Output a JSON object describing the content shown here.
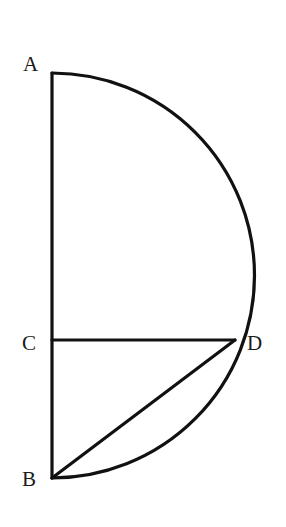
{
  "diagram": {
    "type": "geometry",
    "points": {
      "A": {
        "label": "A",
        "x": 52,
        "y": 73
      },
      "B": {
        "label": "B",
        "x": 52,
        "y": 478
      },
      "C": {
        "label": "C",
        "x": 52,
        "y": 340
      },
      "D": {
        "label": "D",
        "x": 235,
        "y": 340
      }
    },
    "segments": [
      {
        "from": "A",
        "to": "B"
      },
      {
        "from": "C",
        "to": "D"
      },
      {
        "from": "B",
        "to": "D"
      }
    ],
    "arc": {
      "from": "A",
      "to": "B",
      "side": "right",
      "shape": "semicircle"
    },
    "stroke_color": "#111111"
  }
}
